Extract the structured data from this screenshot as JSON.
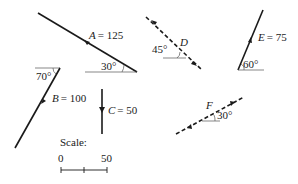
{
  "diagram": {
    "type": "force-vectors",
    "vectors": [
      {
        "id": "A",
        "name_label": "A",
        "eq": "= 125",
        "magnitude": 125,
        "angle_label": "30°",
        "angle": 30,
        "style": "solid"
      },
      {
        "id": "B",
        "name_label": "B",
        "eq": "= 100",
        "magnitude": 100,
        "angle_label": "70°",
        "angle": 70,
        "style": "solid"
      },
      {
        "id": "C",
        "name_label": "C",
        "eq": "= 50",
        "magnitude": 50,
        "style": "solid",
        "direction": "vertical-down"
      },
      {
        "id": "D",
        "name_label": "D",
        "angle_label": "45°",
        "angle": 45,
        "style": "dashed"
      },
      {
        "id": "E",
        "name_label": "E",
        "eq": "= 75",
        "magnitude": 75,
        "angle_label": "60°",
        "angle": 60,
        "style": "solid"
      },
      {
        "id": "F",
        "name_label": "F",
        "angle_label": "30°",
        "angle": 30,
        "style": "dashed"
      }
    ],
    "scale": {
      "title": "Scale:",
      "start_label": "0",
      "end_label": "50"
    }
  }
}
